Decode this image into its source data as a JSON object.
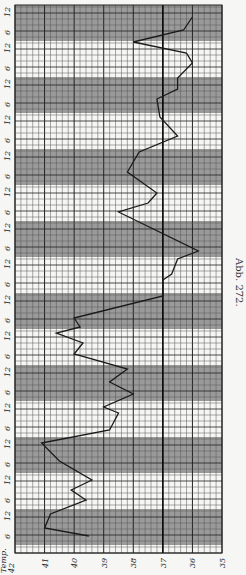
{
  "chart_data": {
    "type": "line",
    "title": "",
    "caption": "Abb. 272.",
    "orientation": "rotated-90 (temperature axis horizontal at bottom, time axis vertical, time runs bottom to top)",
    "xlabel": "Temp.",
    "ylabel": "",
    "temp_axis": {
      "label": "Temp.",
      "ticks": [
        42,
        41,
        40,
        39,
        38,
        37,
        36,
        35
      ],
      "range": [
        42,
        35
      ],
      "reference_line": 37
    },
    "time_axis": {
      "tick_labels_bottom_to_top": [
        "6",
        "12",
        "6",
        "12",
        "6",
        "12",
        "6",
        "12",
        "6",
        "12",
        "6",
        "12",
        "6",
        "12",
        "6",
        "12",
        "6",
        "12",
        "6",
        "12",
        "6",
        "12",
        "6",
        "12",
        "6",
        "12",
        "6",
        "12",
        "6",
        "12",
        "12"
      ],
      "band_note": "alternating shaded (night) and white (day) 12-hour bands"
    },
    "grid": true,
    "legend": null,
    "series": [
      {
        "name": "Temperature",
        "points": [
          {
            "y": 536,
            "temp": 39.5
          },
          {
            "y": 528,
            "temp": 41.0
          },
          {
            "y": 514,
            "temp": 40.8
          },
          {
            "y": 500,
            "temp": 39.6
          },
          {
            "y": 490,
            "temp": 40.1
          },
          {
            "y": 480,
            "temp": 39.4
          },
          {
            "y": 461,
            "temp": 40.5
          },
          {
            "y": 443,
            "temp": 41.1
          },
          {
            "y": 430,
            "temp": 38.8
          },
          {
            "y": 413,
            "temp": 38.5
          },
          {
            "y": 407,
            "temp": 39.0
          },
          {
            "y": 394,
            "temp": 38.0
          },
          {
            "y": 382,
            "temp": 38.8
          },
          {
            "y": 369,
            "temp": 38.2
          },
          {
            "y": 354,
            "temp": 40.0
          },
          {
            "y": 343,
            "temp": 39.7
          },
          {
            "y": 333,
            "temp": 40.6
          },
          {
            "y": 327,
            "temp": 39.8
          },
          {
            "y": 318,
            "temp": 40.0
          },
          {
            "y": 296,
            "temp": 37.0
          },
          {
            "y": 280,
            "temp": 37.0
          },
          {
            "y": 274,
            "temp": 36.7
          },
          {
            "y": 259,
            "temp": 36.5
          },
          {
            "y": 251,
            "temp": 35.8
          },
          {
            "y": 212,
            "temp": 38.5
          },
          {
            "y": 203,
            "temp": 37.5
          },
          {
            "y": 193,
            "temp": 37.2
          },
          {
            "y": 172,
            "temp": 38.2
          },
          {
            "y": 152,
            "temp": 37.8
          },
          {
            "y": 136,
            "temp": 36.5
          },
          {
            "y": 117,
            "temp": 37.1
          },
          {
            "y": 99,
            "temp": 37.2
          },
          {
            "y": 89,
            "temp": 36.5
          },
          {
            "y": 78,
            "temp": 36.5
          },
          {
            "y": 63,
            "temp": 36.0
          },
          {
            "y": 53,
            "temp": 36.2
          },
          {
            "y": 42,
            "temp": 38.0
          },
          {
            "y": 30,
            "temp": 36.3
          },
          {
            "y": 17,
            "temp": 36.0
          }
        ],
        "values": [
          39.5,
          41.0,
          40.8,
          39.6,
          40.1,
          39.4,
          40.5,
          41.1,
          38.8,
          38.5,
          39.0,
          38.0,
          38.8,
          38.2,
          40.0,
          39.7,
          40.6,
          39.8,
          40.0,
          37.0,
          37.0,
          36.7,
          36.5,
          35.8,
          38.5,
          37.5,
          37.2,
          38.2,
          37.8,
          36.5,
          37.1,
          37.2,
          36.5,
          36.5,
          36.0,
          36.2,
          38.0,
          36.3,
          36.0
        ]
      }
    ],
    "colors": {
      "paper": "#f6f6f4",
      "shade": "#9a9a9a",
      "grid_minor": "#555555",
      "grid_major": "#222222",
      "line": "#1a1a1a"
    }
  },
  "layout": {
    "grid_left": 15,
    "grid_right": 222,
    "grid_top": 5,
    "grid_bottom": 553,
    "band_height": 36,
    "first_band_top": -12
  }
}
